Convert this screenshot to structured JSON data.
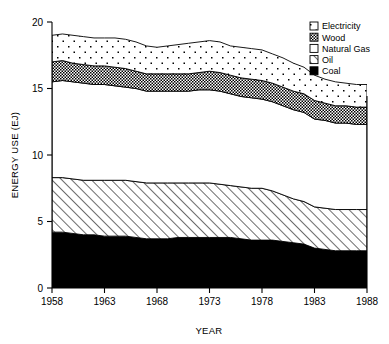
{
  "chart_data": {
    "type": "area",
    "stacked": true,
    "title": "",
    "xlabel": "YEAR",
    "ylabel": "ENERGY USE (EJ)",
    "xlim": [
      1958,
      1988
    ],
    "ylim": [
      0,
      20
    ],
    "xticks": [
      1958,
      1963,
      1968,
      1973,
      1978,
      1983,
      1988
    ],
    "yticks": [
      0,
      5,
      10,
      15,
      20
    ],
    "grid": false,
    "legend_position": "top-right",
    "x": [
      1958,
      1959,
      1960,
      1961,
      1962,
      1963,
      1964,
      1965,
      1966,
      1967,
      1968,
      1969,
      1970,
      1971,
      1972,
      1973,
      1974,
      1975,
      1976,
      1977,
      1978,
      1979,
      1980,
      1981,
      1982,
      1983,
      1984,
      1985,
      1986,
      1987,
      1988
    ],
    "series": [
      {
        "name": "Coal",
        "pattern": "solid-black",
        "values": [
          4.2,
          4.2,
          4.1,
          4.0,
          4.0,
          3.9,
          3.9,
          3.9,
          3.8,
          3.7,
          3.7,
          3.7,
          3.8,
          3.8,
          3.8,
          3.8,
          3.8,
          3.8,
          3.7,
          3.6,
          3.6,
          3.6,
          3.5,
          3.4,
          3.3,
          3.0,
          2.9,
          2.8,
          2.8,
          2.8,
          2.8
        ]
      },
      {
        "name": "Oil",
        "pattern": "diagonal-hatch",
        "values": [
          4.1,
          4.1,
          4.1,
          4.1,
          4.1,
          4.2,
          4.2,
          4.2,
          4.2,
          4.2,
          4.2,
          4.2,
          4.1,
          4.1,
          4.1,
          4.1,
          4.0,
          3.9,
          3.9,
          3.9,
          3.9,
          3.7,
          3.5,
          3.3,
          3.2,
          3.1,
          3.1,
          3.1,
          3.1,
          3.1,
          3.1
        ]
      },
      {
        "name": "Natural Gas",
        "pattern": "blank-white",
        "values": [
          7.2,
          7.3,
          7.3,
          7.3,
          7.2,
          7.2,
          7.1,
          7.0,
          7.0,
          6.9,
          6.9,
          6.9,
          6.9,
          6.9,
          7.0,
          7.0,
          7.0,
          6.9,
          6.8,
          6.8,
          6.7,
          6.7,
          6.7,
          6.7,
          6.7,
          6.6,
          6.6,
          6.5,
          6.5,
          6.4,
          6.4
        ]
      },
      {
        "name": "Wood",
        "pattern": "dense-crosshatch",
        "values": [
          1.5,
          1.5,
          1.4,
          1.4,
          1.4,
          1.4,
          1.4,
          1.4,
          1.3,
          1.3,
          1.3,
          1.3,
          1.3,
          1.3,
          1.3,
          1.4,
          1.4,
          1.4,
          1.4,
          1.4,
          1.4,
          1.4,
          1.4,
          1.4,
          1.4,
          1.4,
          1.3,
          1.3,
          1.3,
          1.3,
          1.3
        ]
      },
      {
        "name": "Electricity",
        "pattern": "dotted-stipple",
        "values": [
          2.0,
          2.0,
          2.1,
          2.1,
          2.1,
          2.1,
          2.2,
          2.2,
          2.2,
          2.1,
          2.0,
          2.1,
          2.2,
          2.3,
          2.3,
          2.3,
          2.3,
          2.2,
          2.3,
          2.3,
          2.3,
          2.2,
          2.2,
          2.1,
          2.0,
          1.9,
          1.8,
          1.8,
          1.7,
          1.7,
          1.7
        ]
      }
    ],
    "stack_order_bottom_to_top": [
      "Coal",
      "Oil",
      "Natural Gas",
      "Wood",
      "Electricity"
    ],
    "legend_entries": [
      "Electricity",
      "Wood",
      "Natural Gas",
      "Oil",
      "Coal"
    ],
    "totals": [
      19.0,
      19.1,
      19.0,
      18.9,
      18.8,
      18.8,
      18.8,
      18.7,
      18.5,
      18.2,
      18.1,
      18.2,
      18.3,
      18.4,
      18.5,
      18.6,
      18.5,
      18.2,
      18.1,
      18.0,
      17.9,
      17.6,
      17.3,
      16.9,
      16.6,
      16.0,
      15.7,
      15.5,
      15.4,
      15.3,
      15.3
    ]
  },
  "colors": {
    "ink": "#000000",
    "background": "#ffffff",
    "coal_fill": "#000000",
    "wood_fill": "#4a4a4a",
    "gas_fill": "#ffffff",
    "oil_fill": "#ffffff",
    "electricity_fill": "#ffffff"
  }
}
